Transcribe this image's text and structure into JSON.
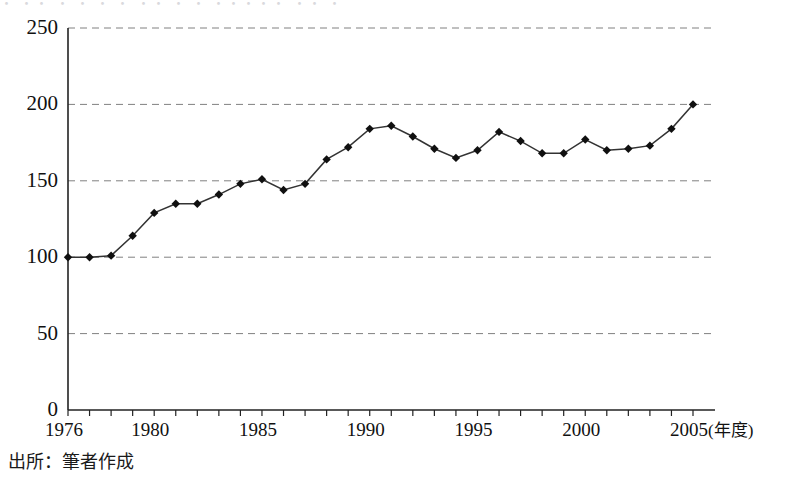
{
  "figure": {
    "caption": "出所：筆者作成",
    "scan_artifact": "・ ・・ ・    ・  ・ ・  ・・ ・ ・ ・・・・・  ・・   ・"
  },
  "chart_data": {
    "type": "line",
    "title": "",
    "subtitle": "",
    "xlabel": "(年度)",
    "ylabel": "",
    "xlim": [
      1976,
      2005
    ],
    "ylim": [
      0,
      250
    ],
    "ytick_values": [
      0,
      50,
      100,
      150,
      200,
      250
    ],
    "ytick_labels": [
      "0",
      "50",
      "100",
      "150",
      "200",
      "250"
    ],
    "xtick_values": [
      1976,
      1980,
      1985,
      1990,
      1995,
      2000,
      2005
    ],
    "xtick_labels": [
      "1976",
      "1980",
      "1985",
      "1990",
      "1995",
      "2000",
      "2005"
    ],
    "xtick_unit_label": "(年度)",
    "grid": "horizontal-dashed",
    "legend": null,
    "marker": "diamond",
    "line_color": "#333333",
    "marker_color": "#101010",
    "grid_color": "#808080",
    "axis_color": "#222222",
    "x": [
      1976,
      1977,
      1978,
      1979,
      1980,
      1981,
      1982,
      1983,
      1984,
      1985,
      1986,
      1987,
      1988,
      1989,
      1990,
      1991,
      1992,
      1993,
      1994,
      1995,
      1996,
      1997,
      1998,
      1999,
      2000,
      2001,
      2002,
      2003,
      2004,
      2005
    ],
    "values": [
      100,
      100,
      101,
      114,
      129,
      135,
      135,
      141,
      148,
      151,
      144,
      148,
      164,
      172,
      184,
      186,
      179,
      171,
      165,
      170,
      182,
      176,
      168,
      168,
      177,
      170,
      171,
      173,
      184,
      200
    ]
  }
}
